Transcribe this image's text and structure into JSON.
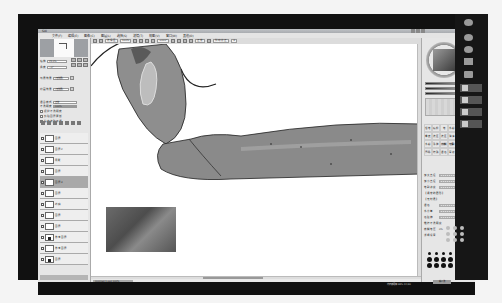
{
  "window": {
    "title": "SAI",
    "menu": [
      "文件(F)",
      "编辑(E)",
      "图像(C)",
      "图层(L)",
      "选择(S)",
      "滤镜(T)",
      "视图(V)",
      "窗口(W)",
      "其他(O)"
    ]
  },
  "toolbar": {
    "selection_label": "选择区",
    "zoom_value": "100%",
    "angle_value": "+000°",
    "mode_label": "正常",
    "stabilizer_label": "抖动修正",
    "stabilizer_value": "3"
  },
  "navigator": {
    "zoom_label": "缩放",
    "zoom_value": "25.0%",
    "angle_label": "角度",
    "angle_value": "+0°"
  },
  "layer_panel": {
    "blend_label": "混合模式",
    "blend_value": "正常",
    "opacity_label": "不透明度",
    "opacity_value": "100%",
    "paper_label": "纸质效果",
    "paper_value": "[无效果]",
    "texture_label": "绘画效果",
    "texture_value": "[无效果]",
    "checks": [
      "保护不透明度",
      "剪贴图层蒙版",
      "指定选取来源"
    ],
    "layers": [
      {
        "name": "图层",
        "mode": "正常",
        "active": false,
        "thumb": "blank"
      },
      {
        "name": "图层2",
        "mode": "正常",
        "active": false,
        "thumb": "blank"
      },
      {
        "name": "阴影",
        "mode": "正常",
        "active": false,
        "thumb": "blank"
      },
      {
        "name": "图层",
        "mode": "正常",
        "active": false,
        "thumb": "blank"
      },
      {
        "name": "图层3",
        "mode": "正常",
        "active": true,
        "thumb": "blank"
      },
      {
        "name": "图层",
        "mode": "正常",
        "active": false,
        "thumb": "blank"
      },
      {
        "name": "线稿",
        "mode": "正常",
        "active": false,
        "thumb": "blank"
      },
      {
        "name": "图层",
        "mode": "正常",
        "active": false,
        "thumb": "blank"
      },
      {
        "name": "图层",
        "mode": "正常",
        "active": false,
        "thumb": "blank"
      },
      {
        "name": "参考图层",
        "mode": "正常",
        "active": false,
        "thumb": "dot"
      },
      {
        "name": "参考图层",
        "mode": "正常",
        "active": false,
        "thumb": "blank"
      },
      {
        "name": "图层",
        "mode": "正常",
        "active": false,
        "thumb": "dot"
      },
      {
        "name": "图层",
        "mode": "正常",
        "active": false,
        "thumb": "blank"
      }
    ]
  },
  "canvas": {
    "tab_label": "Untitled 1.psd",
    "tab_zoom": "100%"
  },
  "color_panel": {
    "slider_labels": [
      "H",
      "S",
      "V"
    ],
    "slider_values": [
      "0",
      "0%",
      "26%"
    ]
  },
  "tool_panel": {
    "brushes": [
      "铅笔",
      "喷枪",
      "笔",
      "水彩",
      "马克",
      "橡皮",
      "选区",
      "选区擦",
      "油漆桶",
      "二值笔",
      "水彩2",
      "涂抹",
      "模糊",
      "笔刷",
      "油画",
      "厚涂",
      "特殊",
      "混色",
      "晕染",
      "渐变"
    ],
    "props": [
      {
        "label": "最大直径",
        "value": "x1.0",
        "size": "15.0"
      },
      {
        "label": "最小直径",
        "value": "0%"
      },
      {
        "label": "笔刷浓度",
        "value": "100"
      },
      {
        "label": "【通常的圆形】",
        "value": ""
      },
      {
        "label": "【无材质】",
        "value": ""
      },
      {
        "label": "混色",
        "value": ""
      },
      {
        "label": "水分量",
        "value": "0"
      },
      {
        "label": "色延伸",
        "value": "0"
      },
      {
        "label": "维持不透明度",
        "value": ""
      },
      {
        "label": "模糊笔压",
        "value": "0%"
      },
      {
        "label": "详细设置",
        "value": ""
      }
    ]
  },
  "status": {
    "memory": "内存使用率 38% 24/30",
    "button": "输入法"
  }
}
